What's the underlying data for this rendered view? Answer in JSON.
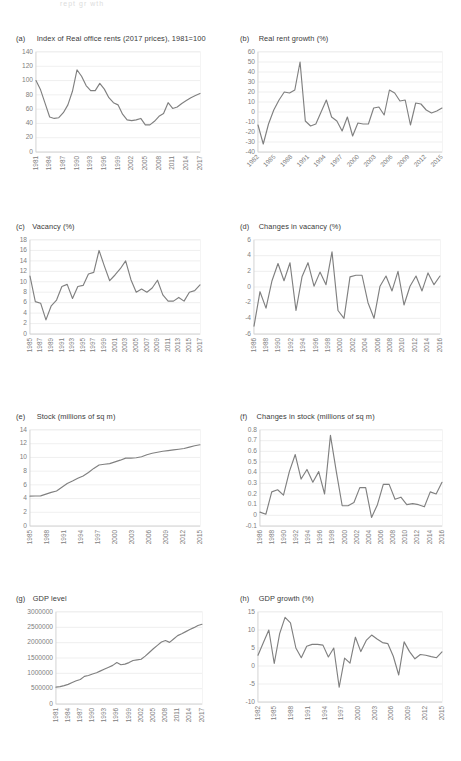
{
  "figure": {
    "cut_header_text": "rept gr wth",
    "line_color": "#808080",
    "gridline_color": "#e8e8e8",
    "text_color": "#3a3a3a",
    "tick_color": "#808080"
  },
  "panels": [
    {
      "key": "a",
      "tag": "(a)",
      "title": "Index of Real office rents (2017 prices), 1981=100"
    },
    {
      "key": "b",
      "tag": "(b)",
      "title": "Real rent growth (%)"
    },
    {
      "key": "c",
      "tag": "(c)",
      "title": "Vacancy (%)"
    },
    {
      "key": "d",
      "tag": "(d)",
      "title": "Changes in vacancy (%)"
    },
    {
      "key": "e",
      "tag": "(e)",
      "title": "Stock (millions of sq m)"
    },
    {
      "key": "f",
      "tag": "(f)",
      "title": "Changes in stock (millions of sq m)"
    },
    {
      "key": "g",
      "tag": "(g)",
      "title": "GDP level"
    },
    {
      "key": "h",
      "tag": "(h)",
      "title": "GDP growth (%)"
    }
  ],
  "chart_data": [
    {
      "id": "a",
      "type": "line",
      "title": "Index of Real office rents (2017 prices), 1981=100",
      "xlabel": "",
      "ylabel": "",
      "ylim": [
        0,
        140
      ],
      "yticks": [
        0,
        20,
        40,
        60,
        80,
        100,
        120,
        140
      ],
      "ytick_labels": [
        "0",
        "20",
        "40",
        "60",
        "80",
        "100",
        "120",
        "140"
      ],
      "grid": true,
      "legend": "none",
      "x": [
        1981,
        1982,
        1983,
        1984,
        1985,
        1986,
        1987,
        1988,
        1989,
        1990,
        1991,
        1992,
        1993,
        1994,
        1995,
        1996,
        1997,
        1998,
        1999,
        2000,
        2001,
        2002,
        2003,
        2004,
        2005,
        2006,
        2007,
        2008,
        2009,
        2010,
        2011,
        2012,
        2013,
        2014,
        2015,
        2016,
        2017
      ],
      "xtick_labels": [
        "1981",
        "1984",
        "1987",
        "1990",
        "1993",
        "1996",
        "1999",
        "2002",
        "2005",
        "2008",
        "2011",
        "2014",
        "2017"
      ],
      "values": [
        100,
        87,
        68,
        49,
        47,
        48,
        55,
        66,
        85,
        115,
        106,
        93,
        86,
        86,
        96,
        88,
        76,
        69,
        66,
        53,
        45,
        44,
        45,
        47,
        38,
        38,
        43,
        50,
        54,
        69,
        61,
        63,
        68,
        72,
        76,
        79,
        82
      ]
    },
    {
      "id": "b",
      "type": "line",
      "title": "Real rent growth (%)",
      "xlabel": "",
      "ylabel": "",
      "ylim": [
        -40,
        60
      ],
      "yticks": [
        -40,
        -30,
        -20,
        -10,
        0,
        10,
        20,
        30,
        40,
        50,
        60
      ],
      "ytick_labels": [
        "-40",
        "-30",
        "-20",
        "-10",
        "0",
        "10",
        "20",
        "30",
        "40",
        "50",
        "60"
      ],
      "grid": true,
      "legend": "none",
      "x": [
        1982,
        1983,
        1984,
        1985,
        1986,
        1987,
        1988,
        1989,
        1990,
        1991,
        1992,
        1993,
        1994,
        1995,
        1996,
        1997,
        1998,
        1999,
        2000,
        2001,
        2002,
        2003,
        2004,
        2005,
        2006,
        2007,
        2008,
        2009,
        2010,
        2011,
        2012,
        2013,
        2014,
        2015,
        2016,
        2017
      ],
      "xtick_labels": [
        "1982",
        "1985",
        "1988",
        "1991",
        "1994",
        "1997",
        "2000",
        "2003",
        "2006",
        "2009",
        "2012",
        "2015"
      ],
      "values": [
        -13,
        -32,
        -12,
        2,
        12,
        20,
        19,
        22,
        50,
        -9,
        -14,
        -12,
        0,
        12,
        -5,
        -9,
        -19,
        -5,
        -24,
        -11,
        -12,
        -12,
        4,
        5,
        -3,
        22,
        19,
        11,
        12,
        -13,
        9,
        8,
        2,
        -1,
        1,
        4
      ]
    },
    {
      "id": "c",
      "type": "line",
      "title": "Vacancy (%)",
      "xlabel": "",
      "ylabel": "",
      "ylim": [
        0,
        18
      ],
      "yticks": [
        0,
        2,
        4,
        6,
        8,
        10,
        12,
        14,
        16,
        18
      ],
      "ytick_labels": [
        "0",
        "2",
        "4",
        "6",
        "8",
        "10",
        "12",
        "14",
        "16",
        "18"
      ],
      "grid": true,
      "legend": "none",
      "x": [
        1985,
        1986,
        1987,
        1988,
        1989,
        1990,
        1991,
        1992,
        1993,
        1994,
        1995,
        1996,
        1997,
        1998,
        1999,
        2000,
        2001,
        2002,
        2003,
        2004,
        2005,
        2006,
        2007,
        2008,
        2009,
        2010,
        2011,
        2012,
        2013,
        2014,
        2015,
        2016,
        2017
      ],
      "xtick_labels": [
        "1985",
        "1987",
        "1989",
        "1991",
        "1993",
        "1995",
        "1997",
        "1999",
        "2001",
        "2003",
        "2005",
        "2007",
        "2009",
        "2011",
        "2013",
        "2015",
        "2017"
      ],
      "values": [
        11.1,
        6.2,
        5.9,
        2.7,
        5.4,
        6.5,
        9.1,
        9.5,
        6.8,
        9.1,
        9.3,
        11.5,
        11.8,
        16.0,
        13.0,
        10.2,
        11.3,
        12.5,
        14.0,
        10.4,
        8.0,
        8.6,
        8.0,
        8.8,
        10.3,
        7.5,
        6.3,
        6.3,
        7.0,
        6.3,
        8.0,
        8.3,
        9.4
      ]
    },
    {
      "id": "d",
      "type": "line",
      "title": "Changes in vacancy (%)",
      "xlabel": "",
      "ylabel": "",
      "ylim": [
        -6,
        6
      ],
      "yticks": [
        -6,
        -4,
        -2,
        0,
        2,
        4,
        6
      ],
      "ytick_labels": [
        "-6",
        "-4",
        "-2",
        "0",
        "2",
        "4",
        "6"
      ],
      "grid": true,
      "legend": "none",
      "x": [
        1986,
        1987,
        1988,
        1989,
        1990,
        1991,
        1992,
        1993,
        1994,
        1995,
        1996,
        1997,
        1998,
        1999,
        2000,
        2001,
        2002,
        2003,
        2004,
        2005,
        2006,
        2007,
        2008,
        2009,
        2010,
        2011,
        2012,
        2013,
        2014,
        2015,
        2016,
        2017
      ],
      "xtick_labels": [
        "1986",
        "1988",
        "1990",
        "1992",
        "1994",
        "1996",
        "1998",
        "2000",
        "2002",
        "2004",
        "2006",
        "2008",
        "2010",
        "2012",
        "2014",
        "2016"
      ],
      "values": [
        -5.0,
        -0.6,
        -2.7,
        0.8,
        3.0,
        0.8,
        3.1,
        -3.0,
        1.3,
        3.1,
        0.1,
        1.9,
        0.3,
        4.5,
        -3.0,
        -4.0,
        1.3,
        1.5,
        1.5,
        -2.0,
        -4.0,
        0.1,
        1.4,
        -0.5,
        2.0,
        -2.3,
        0.1,
        1.4,
        -0.5,
        1.8,
        0.3,
        1.4
      ]
    },
    {
      "id": "e",
      "type": "line",
      "title": "Stock (millions of sq m)",
      "xlabel": "",
      "ylabel": "",
      "ylim": [
        0,
        14
      ],
      "yticks": [
        0,
        2,
        4,
        6,
        8,
        10,
        12,
        14
      ],
      "ytick_labels": [
        "0",
        "2",
        "4",
        "6",
        "8",
        "10",
        "12",
        "14"
      ],
      "grid": true,
      "legend": "none",
      "x": [
        1985,
        1986,
        1987,
        1988,
        1989,
        1990,
        1991,
        1992,
        1993,
        1994,
        1995,
        1996,
        1997,
        1998,
        1999,
        2000,
        2001,
        2002,
        2003,
        2004,
        2005,
        2006,
        2007,
        2008,
        2009,
        2010,
        2011,
        2012,
        2013,
        2014,
        2015,
        2016,
        2017
      ],
      "xtick_labels": [
        "1985",
        "1988",
        "1991",
        "1994",
        "1997",
        "2000",
        "2003",
        "2006",
        "2009",
        "2012",
        "2015"
      ],
      "values": [
        4.35,
        4.38,
        4.4,
        4.65,
        4.9,
        5.1,
        5.65,
        6.2,
        6.55,
        6.95,
        7.3,
        7.8,
        8.4,
        8.9,
        9.0,
        9.1,
        9.35,
        9.6,
        9.9,
        9.9,
        9.95,
        10.1,
        10.4,
        10.6,
        10.75,
        10.9,
        11.0,
        11.1,
        11.2,
        11.3,
        11.5,
        11.7,
        11.85
      ]
    },
    {
      "id": "f",
      "type": "line",
      "title": "Changes in stock (millions of sq m)",
      "xlabel": "",
      "ylabel": "",
      "ylim": [
        -0.1,
        0.8
      ],
      "yticks": [
        -0.1,
        0,
        0.1,
        0.2,
        0.3,
        0.4,
        0.5,
        0.6,
        0.7,
        0.8
      ],
      "ytick_labels": [
        "-0.1",
        "0",
        "0.1",
        "0.2",
        "0.3",
        "0.4",
        "0.5",
        "0.6",
        "0.7",
        "0.8"
      ],
      "grid": true,
      "legend": "none",
      "x": [
        1986,
        1987,
        1988,
        1989,
        1990,
        1991,
        1992,
        1993,
        1994,
        1995,
        1996,
        1997,
        1998,
        1999,
        2000,
        2001,
        2002,
        2003,
        2004,
        2005,
        2006,
        2007,
        2008,
        2009,
        2010,
        2011,
        2012,
        2013,
        2014,
        2015,
        2016,
        2017
      ],
      "xtick_labels": [
        "1986",
        "1988",
        "1990",
        "1992",
        "1994",
        "1996",
        "1998",
        "2000",
        "2002",
        "2004",
        "2006",
        "2008",
        "2010",
        "2012",
        "2014",
        "2016"
      ],
      "values": [
        0.03,
        0.01,
        0.22,
        0.24,
        0.19,
        0.41,
        0.57,
        0.34,
        0.43,
        0.31,
        0.41,
        0.2,
        0.75,
        0.41,
        0.09,
        0.09,
        0.12,
        0.26,
        0.26,
        -0.02,
        0.1,
        0.29,
        0.29,
        0.15,
        0.17,
        0.1,
        0.11,
        0.1,
        0.08,
        0.22,
        0.2,
        0.31
      ]
    },
    {
      "id": "g",
      "type": "line",
      "title": "GDP level",
      "xlabel": "",
      "ylabel": "",
      "ylim": [
        0,
        3000000
      ],
      "yticks": [
        0,
        500000,
        1000000,
        1500000,
        2000000,
        2500000,
        3000000
      ],
      "ytick_labels": [
        "0",
        "500000",
        "1000000",
        "1500000",
        "2000000",
        "2500000",
        "3000000"
      ],
      "grid": true,
      "legend": "none",
      "x": [
        1981,
        1982,
        1983,
        1984,
        1985,
        1986,
        1987,
        1988,
        1989,
        1990,
        1991,
        1992,
        1993,
        1994,
        1995,
        1996,
        1997,
        1998,
        1999,
        2000,
        2001,
        2002,
        2003,
        2004,
        2005,
        2006,
        2007,
        2008,
        2009,
        2010,
        2011,
        2012,
        2013,
        2014,
        2015,
        2016,
        2017
      ],
      "xtick_labels": [
        "1981",
        "1984",
        "1987",
        "1990",
        "1993",
        "1996",
        "1999",
        "2002",
        "2005",
        "2008",
        "2011",
        "2014",
        "2017"
      ],
      "values": [
        550000,
        565000,
        600000,
        640000,
        700000,
        760000,
        800000,
        900000,
        930000,
        980000,
        1020000,
        1080000,
        1140000,
        1200000,
        1260000,
        1350000,
        1280000,
        1300000,
        1350000,
        1420000,
        1440000,
        1460000,
        1560000,
        1680000,
        1800000,
        1910000,
        2020000,
        2070000,
        2010000,
        2120000,
        2230000,
        2290000,
        2360000,
        2430000,
        2490000,
        2560000,
        2600000
      ]
    },
    {
      "id": "h",
      "type": "line",
      "title": "GDP growth (%)",
      "xlabel": "",
      "ylabel": "",
      "ylim": [
        -10,
        15
      ],
      "yticks": [
        -10,
        -5,
        0,
        5,
        10,
        15
      ],
      "ytick_labels": [
        "-10",
        "-5",
        "0",
        "5",
        "10",
        "15"
      ],
      "grid": true,
      "legend": "none",
      "x": [
        1982,
        1983,
        1984,
        1985,
        1986,
        1987,
        1988,
        1989,
        1990,
        1991,
        1992,
        1993,
        1994,
        1995,
        1996,
        1997,
        1998,
        1999,
        2000,
        2001,
        2002,
        2003,
        2004,
        2005,
        2006,
        2007,
        2008,
        2009,
        2010,
        2011,
        2012,
        2013,
        2014,
        2015,
        2016,
        2017
      ],
      "xtick_labels": [
        "1982",
        "1985",
        "1988",
        "1991",
        "1994",
        "1997",
        "2000",
        "2003",
        "2006",
        "2009",
        "2012",
        "2015"
      ],
      "values": [
        3.0,
        6.5,
        10.0,
        0.7,
        9.0,
        13.5,
        12.0,
        5.0,
        2.3,
        5.5,
        6.0,
        6.0,
        5.8,
        2.5,
        5.0,
        -5.9,
        2.2,
        0.8,
        8.0,
        4.0,
        7.1,
        8.6,
        7.5,
        6.5,
        6.2,
        2.7,
        -2.5,
        6.7,
        4.0,
        2.0,
        3.2,
        3.0,
        2.6,
        2.3,
        3.9
      ]
    }
  ]
}
